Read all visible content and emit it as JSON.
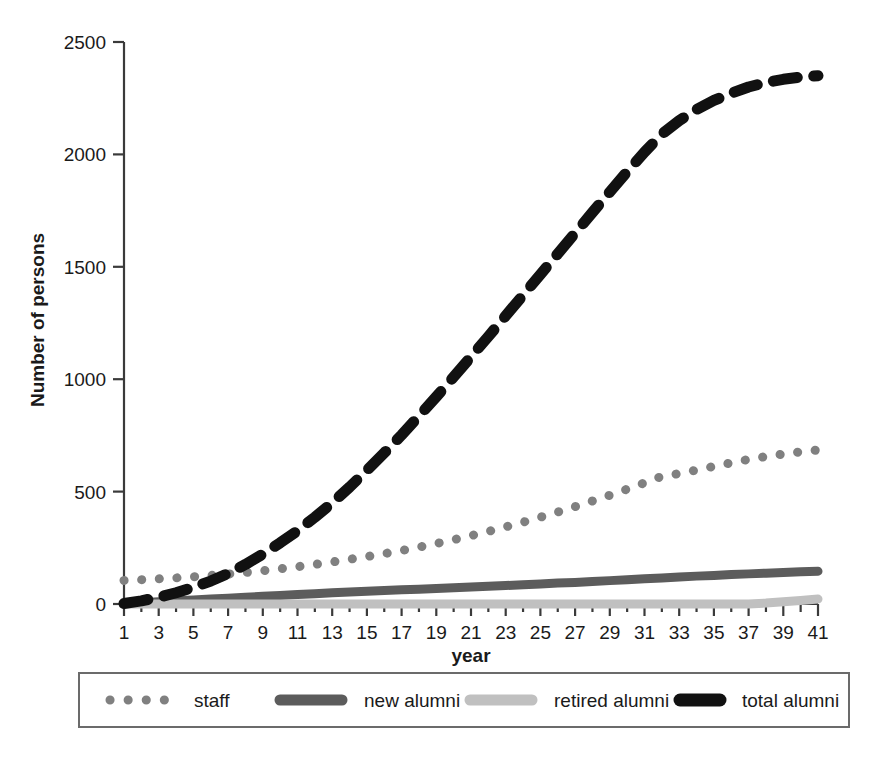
{
  "chart_data": {
    "type": "line",
    "title": "",
    "xlabel": "year",
    "ylabel": "Number of persons",
    "xlim": [
      1,
      41
    ],
    "ylim": [
      0,
      2500
    ],
    "yticks": [
      0,
      500,
      1000,
      1500,
      2000,
      2500
    ],
    "ytick_labels": [
      "0",
      "500",
      "1000",
      "1500",
      "2000",
      "2500"
    ],
    "xticks": [
      1,
      3,
      5,
      7,
      9,
      11,
      13,
      15,
      17,
      19,
      21,
      23,
      25,
      27,
      29,
      31,
      33,
      35,
      37,
      39,
      41
    ],
    "xtick_labels": [
      "1",
      "3",
      "5",
      "7",
      "9",
      "11",
      "13",
      "15",
      "17",
      "19",
      "21",
      "23",
      "25",
      "27",
      "29",
      "31",
      "33",
      "35",
      "37",
      "39",
      "41"
    ],
    "minor_xticks_every": 1,
    "grid": false,
    "legend_position": "bottom",
    "x": [
      1,
      2,
      3,
      4,
      5,
      6,
      7,
      8,
      9,
      10,
      11,
      12,
      13,
      14,
      15,
      16,
      17,
      18,
      19,
      20,
      21,
      22,
      23,
      24,
      25,
      26,
      27,
      28,
      29,
      30,
      31,
      32,
      33,
      34,
      35,
      36,
      37,
      38,
      39,
      40,
      41
    ],
    "series": [
      {
        "name": "staff",
        "style": "dotted",
        "color": "#808080",
        "width": 9,
        "values": [
          105,
          108,
          112,
          116,
          121,
          127,
          133,
          140,
          148,
          157,
          166,
          176,
          187,
          199,
          211,
          224,
          238,
          253,
          269,
          286,
          304,
          323,
          343,
          364,
          386,
          409,
          433,
          458,
          484,
          511,
          539,
          568,
          580,
          596,
          612,
          628,
          643,
          656,
          667,
          677,
          685
        ]
      },
      {
        "name": "new alumni",
        "style": "solid",
        "color": "#5c5c5c",
        "width": 9,
        "values": [
          2,
          6,
          10,
          14,
          18,
          22,
          26,
          30,
          34,
          38,
          42,
          46,
          50,
          53,
          57,
          60,
          63,
          66,
          69,
          72,
          76,
          79,
          82,
          86,
          89,
          93,
          96,
          100,
          104,
          108,
          112,
          116,
          120,
          124,
          127,
          131,
          134,
          137,
          140,
          143,
          146
        ]
      },
      {
        "name": "retired alumni",
        "style": "solid",
        "color": "#c0c0c0",
        "width": 9,
        "values": [
          0,
          0,
          0,
          0,
          0,
          0,
          0,
          0,
          0,
          0,
          0,
          0,
          0,
          0,
          0,
          0,
          0,
          0,
          0,
          0,
          0,
          0,
          0,
          0,
          0,
          0,
          0,
          0,
          0,
          0,
          0,
          0,
          0,
          0,
          0,
          0,
          0,
          4,
          10,
          16,
          22
        ]
      },
      {
        "name": "total alumni",
        "style": "dashed",
        "color": "#111111",
        "width": 11,
        "values": [
          2,
          14,
          30,
          50,
          74,
          102,
          136,
          176,
          222,
          272,
          326,
          386,
          450,
          520,
          595,
          672,
          752,
          836,
          922,
          1010,
          1100,
          1190,
          1282,
          1374,
          1466,
          1558,
          1650,
          1742,
          1833,
          1923,
          2010,
          2090,
          2150,
          2200,
          2240,
          2272,
          2300,
          2320,
          2334,
          2344,
          2350
        ]
      }
    ]
  },
  "legend": {
    "entries": [
      {
        "label": "staff",
        "swatch": "dotted-gray-swatch"
      },
      {
        "label": "new alumni",
        "swatch": "solid-darkgray-swatch"
      },
      {
        "label": "retired alumni",
        "swatch": "solid-lightgray-swatch"
      },
      {
        "label": "total alumni",
        "swatch": "dashed-black-swatch"
      }
    ]
  },
  "colors": {
    "staff": "#808080",
    "new_alumni": "#5c5c5c",
    "retired_alumni": "#c0c0c0",
    "total_alumni": "#111111",
    "axis": "#3a3a3a",
    "text": "#1a1a1a"
  }
}
